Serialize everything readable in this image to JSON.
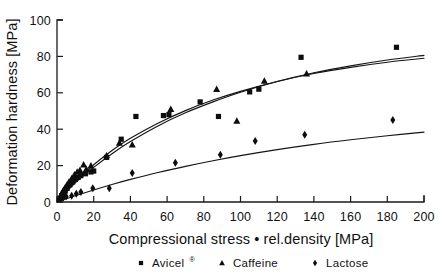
{
  "chart_data": {
    "type": "scatter",
    "title": "",
    "xlabel": "Compressional stress • rel.density [MPa]",
    "ylabel": "Deformation hardness [MPa]",
    "xlim": [
      0,
      200
    ],
    "ylim": [
      0,
      100
    ],
    "xticks": [
      0,
      20,
      40,
      60,
      80,
      100,
      120,
      140,
      160,
      180,
      200
    ],
    "yticks": [
      0,
      20,
      40,
      60,
      80,
      100
    ],
    "grid": false,
    "legend_position": "bottom",
    "series": [
      {
        "name": "Avicel",
        "name_suffix": "®",
        "marker": "square",
        "points": [
          [
            1.5,
            2.0
          ],
          [
            2.5,
            3.5
          ],
          [
            3.5,
            5.0
          ],
          [
            4.5,
            6.0
          ],
          [
            5.5,
            7.5
          ],
          [
            7.0,
            9.5
          ],
          [
            8.5,
            11.0
          ],
          [
            10.0,
            12.5
          ],
          [
            11.5,
            13.5
          ],
          [
            13.0,
            14.5
          ],
          [
            15.5,
            15.5
          ],
          [
            18.5,
            16.5
          ],
          [
            20.0,
            17.0
          ],
          [
            27.0,
            24.5
          ],
          [
            35.0,
            34.5
          ],
          [
            43.0,
            47.0
          ],
          [
            58.0,
            47.5
          ],
          [
            61.0,
            48.0
          ],
          [
            78.0,
            55.0
          ],
          [
            88.0,
            47.0
          ],
          [
            105.0,
            60.5
          ],
          [
            110.0,
            62.0
          ],
          [
            133.0,
            79.5
          ],
          [
            185.0,
            85.0
          ]
        ],
        "fit_curve": [
          [
            0,
            0
          ],
          [
            10,
            10.5
          ],
          [
            20,
            19.0
          ],
          [
            30,
            26.5
          ],
          [
            40,
            33.2
          ],
          [
            55,
            41.8
          ],
          [
            70,
            49.0
          ],
          [
            85,
            55.0
          ],
          [
            100,
            60.3
          ],
          [
            120,
            66.2
          ],
          [
            140,
            71.0
          ],
          [
            160,
            74.8
          ],
          [
            180,
            78.0
          ],
          [
            200,
            80.6
          ]
        ]
      },
      {
        "name": "Caffeine",
        "marker": "triangle",
        "points": [
          [
            1.5,
            2.5
          ],
          [
            2.5,
            4.5
          ],
          [
            3.5,
            6.5
          ],
          [
            4.5,
            8.0
          ],
          [
            5.5,
            9.5
          ],
          [
            6.5,
            11.0
          ],
          [
            8.0,
            13.0
          ],
          [
            9.5,
            15.0
          ],
          [
            11.0,
            16.5
          ],
          [
            12.5,
            17.5
          ],
          [
            14.5,
            20.5
          ],
          [
            16.0,
            18.0
          ],
          [
            18.5,
            20.0
          ],
          [
            27.0,
            25.5
          ],
          [
            34.0,
            32.5
          ],
          [
            41.0,
            31.5
          ],
          [
            62.0,
            51.0
          ],
          [
            87.0,
            62.0
          ],
          [
            98.0,
            44.5
          ],
          [
            113.0,
            66.5
          ],
          [
            136.0,
            70.5
          ]
        ],
        "fit_curve": [
          [
            0,
            0
          ],
          [
            10,
            11.2
          ],
          [
            20,
            20.5
          ],
          [
            30,
            28.3
          ],
          [
            40,
            35.0
          ],
          [
            55,
            43.3
          ],
          [
            70,
            50.2
          ],
          [
            85,
            56.0
          ],
          [
            100,
            60.8
          ],
          [
            120,
            66.2
          ],
          [
            140,
            70.6
          ],
          [
            160,
            74.0
          ],
          [
            180,
            76.8
          ],
          [
            200,
            79.0
          ]
        ]
      },
      {
        "name": "Lactose",
        "marker": "diamond",
        "points": [
          [
            2.0,
            1.5
          ],
          [
            3.5,
            2.5
          ],
          [
            5.0,
            3.0
          ],
          [
            8.0,
            3.5
          ],
          [
            10.5,
            4.5
          ],
          [
            13.0,
            5.5
          ],
          [
            19.5,
            7.5
          ],
          [
            28.5,
            7.5
          ],
          [
            41.0,
            16.0
          ],
          [
            64.5,
            21.5
          ],
          [
            89.0,
            26.0
          ],
          [
            108.0,
            33.5
          ],
          [
            135.0,
            37.0
          ],
          [
            183.0,
            45.0
          ]
        ],
        "fit_curve": [
          [
            0,
            0
          ],
          [
            10,
            3.4
          ],
          [
            20,
            6.6
          ],
          [
            30,
            9.6
          ],
          [
            40,
            12.4
          ],
          [
            55,
            16.2
          ],
          [
            70,
            19.6
          ],
          [
            85,
            22.7
          ],
          [
            100,
            25.5
          ],
          [
            120,
            28.8
          ],
          [
            140,
            31.7
          ],
          [
            160,
            34.2
          ],
          [
            180,
            36.4
          ],
          [
            200,
            38.4
          ]
        ]
      }
    ]
  },
  "legend": {
    "items": [
      {
        "marker": "square",
        "label": "Avicel",
        "sup": "®"
      },
      {
        "marker": "triangle",
        "label": "Caffeine",
        "sup": ""
      },
      {
        "marker": "diamond",
        "label": "Lactose",
        "sup": ""
      }
    ]
  }
}
